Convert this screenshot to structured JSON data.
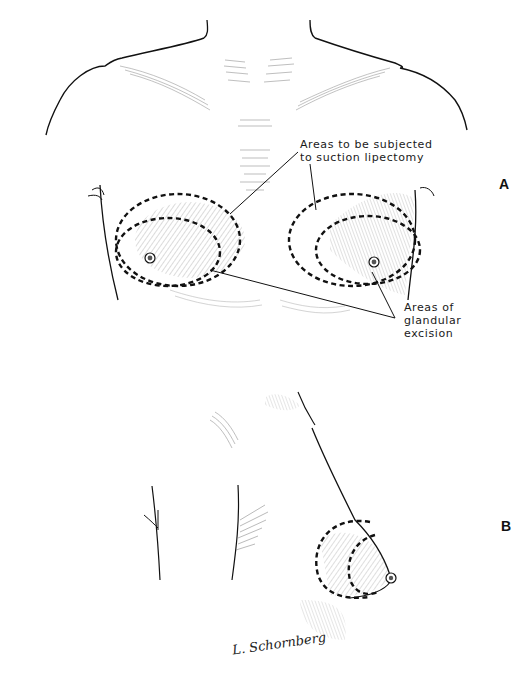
{
  "figure": {
    "panels": [
      {
        "id": "A",
        "letter": "A",
        "view": "frontal chest view with marked breast areas"
      },
      {
        "id": "B",
        "letter": "B",
        "view": "lateral view of breast with marked areas"
      }
    ],
    "annotations": {
      "suction_label": "Areas to be subjected\nto suction lipectomy",
      "glandular_label": "Areas of\nglandular\nexcision"
    },
    "signature": "L. Schornberg",
    "caption": "",
    "colors": {
      "ink": "#1a1a1a",
      "dashed_outline": "#111111",
      "hatching": "#555555",
      "background": "#ffffff"
    }
  }
}
